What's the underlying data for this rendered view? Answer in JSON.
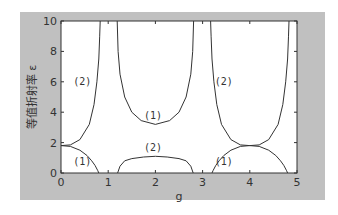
{
  "chart_data": {
    "type": "line",
    "title": "",
    "xlabel": "g",
    "ylabel": "等值折射率 ε",
    "xlim": [
      0,
      5
    ],
    "ylim": [
      0,
      10
    ],
    "xticks": [
      "0",
      "1",
      "2",
      "3",
      "4",
      "5"
    ],
    "yticks": [
      "0",
      "2",
      "4",
      "6",
      "8",
      "10"
    ],
    "grid": false,
    "legend": null,
    "annotations": [
      {
        "text": "(2)",
        "x": 0.45,
        "y": 6.0
      },
      {
        "text": "(1)",
        "x": 0.45,
        "y": 0.7
      },
      {
        "text": "(1)",
        "x": 1.95,
        "y": 3.75
      },
      {
        "text": "(2)",
        "x": 1.95,
        "y": 1.65
      },
      {
        "text": "(2)",
        "x": 3.45,
        "y": 6.0
      },
      {
        "text": "(1)",
        "x": 3.45,
        "y": 0.7
      }
    ],
    "series": [
      {
        "name": "(2) band 1",
        "x": [
          0.0,
          0.2,
          0.4,
          0.6,
          0.7,
          0.76,
          0.8,
          0.82,
          0.83
        ],
        "y": [
          1.8,
          1.85,
          2.2,
          3.2,
          4.5,
          6.0,
          7.5,
          9.0,
          10.0
        ]
      },
      {
        "name": "(1) band 1",
        "x": [
          0.0,
          0.2,
          0.4,
          0.55,
          0.65,
          0.72,
          0.78,
          0.8
        ],
        "y": [
          1.8,
          1.75,
          1.5,
          1.15,
          0.8,
          0.5,
          0.15,
          0.0
        ]
      },
      {
        "name": "(1) central",
        "x": [
          1.19,
          1.21,
          1.25,
          1.35,
          1.5,
          1.7,
          2.0,
          2.3,
          2.5,
          2.65,
          2.75,
          2.79,
          2.81
        ],
        "y": [
          10.0,
          8.0,
          6.5,
          5.0,
          4.0,
          3.45,
          3.2,
          3.45,
          4.0,
          5.0,
          6.5,
          8.0,
          10.0
        ]
      },
      {
        "name": "(2) central",
        "x": [
          1.2,
          1.25,
          1.35,
          1.5,
          1.75,
          2.0,
          2.25,
          2.5,
          2.65,
          2.75,
          2.8
        ],
        "y": [
          0.0,
          0.45,
          0.8,
          0.95,
          1.05,
          1.1,
          1.05,
          0.95,
          0.8,
          0.45,
          0.0
        ]
      },
      {
        "name": "(2) band 3",
        "x": [
          3.17,
          3.18,
          3.2,
          3.24,
          3.3,
          3.4,
          3.6,
          3.8,
          4.0,
          4.2,
          4.4,
          4.6,
          4.7,
          4.76,
          4.8,
          4.82,
          4.83
        ],
        "y": [
          10.0,
          9.0,
          7.5,
          6.0,
          4.5,
          3.2,
          2.2,
          1.85,
          1.8,
          1.85,
          2.2,
          3.2,
          4.5,
          6.0,
          7.5,
          9.0,
          10.0
        ]
      },
      {
        "name": "(1) band 3",
        "x": [
          3.2,
          3.22,
          3.28,
          3.35,
          3.45,
          3.6,
          3.8,
          4.0,
          4.2,
          4.4,
          4.55,
          4.65,
          4.72,
          4.78,
          4.8
        ],
        "y": [
          0.0,
          0.15,
          0.5,
          0.8,
          1.15,
          1.5,
          1.75,
          1.8,
          1.75,
          1.5,
          1.15,
          0.8,
          0.5,
          0.15,
          0.0
        ]
      }
    ]
  },
  "figure": {
    "background": "#c0c0c0",
    "axes_background": "#ffffff",
    "line_color": "#333333"
  }
}
